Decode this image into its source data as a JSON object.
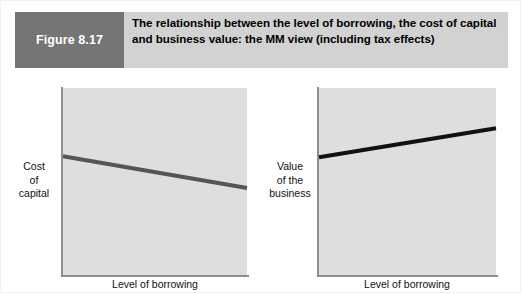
{
  "figure": {
    "tag_label": "Figure 8.17",
    "title": "The relationship between the level of borrowing, the cost of capital and business value: the MM view (including tax effects)",
    "tag_background": "#757575",
    "header_background": "#d2d2d2",
    "tag_text_color": "#ffffff",
    "title_text_color": "#000000"
  },
  "chart_data": [
    {
      "type": "line",
      "name": "cost-of-capital",
      "title": "",
      "xlabel": "Level of borrowing",
      "ylabel": "Cost\nof\ncapital",
      "ylabel_lines": [
        "Cost",
        "of",
        "capital"
      ],
      "grid": false,
      "legend": false,
      "plot_background": "#dedede",
      "axis_color": "#8e8e8e",
      "line_color": "#555555",
      "line_width": 4,
      "xlim": [
        0,
        1
      ],
      "ylim": [
        0,
        1
      ],
      "series": [
        {
          "name": "Cost of capital (MM with tax)",
          "x": [
            0.0,
            1.0
          ],
          "y": [
            0.635,
            0.465
          ],
          "description": "straight line sloping gently downward from left to right"
        }
      ]
    },
    {
      "type": "line",
      "name": "value-of-business",
      "title": "",
      "xlabel": "Level of borrowing",
      "ylabel": "Value\nof the\nbusiness",
      "ylabel_lines": [
        "Value",
        "of the",
        "business"
      ],
      "grid": false,
      "legend": false,
      "plot_background": "#dedede",
      "axis_color": "#8e8e8e",
      "line_color": "#111111",
      "line_width": 4,
      "xlim": [
        0,
        1
      ],
      "ylim": [
        0,
        1
      ],
      "series": [
        {
          "name": "Value of the business (MM with tax)",
          "x": [
            0.0,
            1.0
          ],
          "y": [
            0.63,
            0.785
          ],
          "description": "straight line sloping gently upward from left to right"
        }
      ]
    }
  ]
}
